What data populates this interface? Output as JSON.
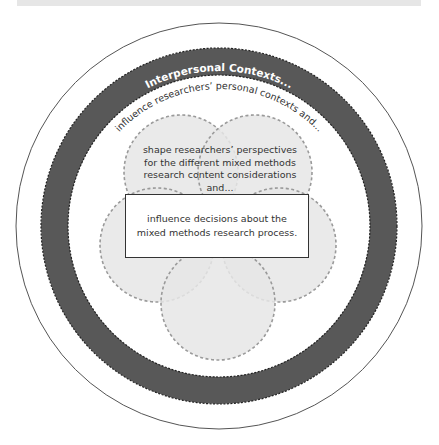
{
  "diagram": {
    "outer_ring_label": "Interpersonal Contexts...",
    "inner_arc_label": "influence researchers’ personal contexts and...",
    "perspectives_text": "shape researchers’ perspectives for the different mixed methods research content considerations and...",
    "decisions_text": "influence decisions about the mixed methods research process.",
    "colors": {
      "ring": "#585858",
      "petal_fill": "#e8e8e8",
      "petal_border": "#9a9a9a",
      "outer_line": "#555555",
      "text": "#333333",
      "ring_text": "#ffffff"
    },
    "petal_count": 5
  }
}
